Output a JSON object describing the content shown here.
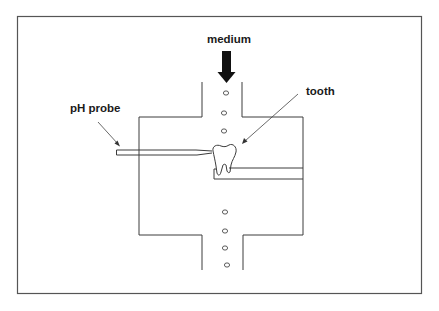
{
  "diagram": {
    "labels": {
      "medium": "medium",
      "tooth": "tooth",
      "ph_probe": "pH probe"
    },
    "components": [
      {
        "id": "medium-inlet-arrow",
        "description": "Bold downward arrow indicating medium flow into channel"
      },
      {
        "id": "upper-channel",
        "description": "Vertical inlet channel"
      },
      {
        "id": "chamber",
        "description": "Rectangular flow chamber"
      },
      {
        "id": "lower-channel",
        "description": "Vertical outlet channel"
      },
      {
        "id": "tooth",
        "description": "Tooth specimen mounted on holder"
      },
      {
        "id": "tooth-holder",
        "description": "Horizontal holder bar from right wall"
      },
      {
        "id": "ph-probe",
        "description": "Horizontal needle probe touching tooth"
      },
      {
        "id": "bubbles",
        "description": "Medium flow bubbles",
        "count_upper": 3,
        "count_lower": 4
      }
    ],
    "colors": {
      "line": "#3c3c3c",
      "arrow_fill": "#111111",
      "background": "#ffffff",
      "frame": "#555555"
    }
  }
}
